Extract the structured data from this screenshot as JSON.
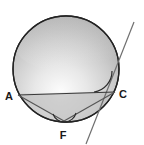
{
  "figure": {
    "background_color": "#ffffff"
  },
  "circle": {
    "name": "main-circle",
    "center_x": 66,
    "center_y": 69,
    "radius": 53,
    "stroke_color": "#222222",
    "stroke_width": 1.3,
    "fill_top_color": "#fefefe",
    "fill_mid_color": "#c9c9c9",
    "fill_edge_color": "#9a9a9a"
  },
  "points": [
    {
      "id": "A",
      "label": "A",
      "x": 18,
      "y": 95,
      "label_x": 9,
      "label_y": 100
    },
    {
      "id": "C",
      "label": "C",
      "x": 115,
      "y": 92,
      "label_x": 120,
      "label_y": 98
    },
    {
      "id": "F",
      "label": "F",
      "x": 64,
      "y": 121,
      "label_x": 61,
      "label_y": 138
    }
  ],
  "segments": [
    {
      "name": "chord-ac",
      "from": "A",
      "to": "C",
      "x1": 18,
      "y1": 95,
      "x2": 115,
      "y2": 92,
      "stroke_color": "#3a3a3a",
      "stroke_width": 1.2
    },
    {
      "name": "segment-af",
      "from": "A",
      "to": "F",
      "x1": 18,
      "y1": 95,
      "x2": 64,
      "y2": 121,
      "stroke_color": "#555555",
      "stroke_width": 1.1
    },
    {
      "name": "segment-fc",
      "from": "F",
      "to": "C",
      "x1": 64,
      "y1": 121,
      "x2": 115,
      "y2": 92,
      "stroke_color": "#555555",
      "stroke_width": 1.1
    }
  ],
  "tangent_line": {
    "name": "tangent-line-at-c",
    "x1": 134,
    "y1": 22,
    "x2": 86,
    "y2": 144,
    "stroke_color": "#6f6f6f",
    "stroke_width": 1.2
  },
  "angle_marks": [
    {
      "name": "angle-arc-at-c",
      "vertex": "C",
      "path": "M 94 92 A 21 21 0 0 0 112 71",
      "stroke_color": "#2b2b2b",
      "stroke_width": 1.2
    },
    {
      "name": "angle-arc-at-f",
      "vertex": "F",
      "path": "M 53 114 A 12 12 0 0 0 76 113",
      "stroke_color": "#2b2b2b",
      "stroke_width": 1.1
    }
  ],
  "shaded_region": {
    "name": "lower-segment-shading",
    "fill_color": "#b0b0b0",
    "opacity": 0.45
  }
}
